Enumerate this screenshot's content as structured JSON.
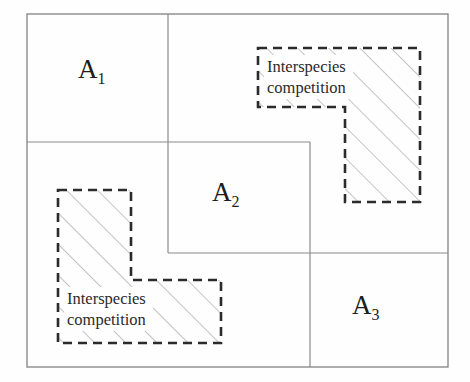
{
  "figure": {
    "type": "diagram",
    "background_color": "#fefefe",
    "line_color": "#8a8a8a",
    "dashed_color": "#2b2b2b",
    "hatch_color": "#8a8a8a",
    "text_color": "#1d1d1d"
  },
  "outer_frame": {
    "x": 27,
    "y": 14,
    "width": 421,
    "height": 353
  },
  "regions": [
    {
      "id": "A1",
      "label_base": "A",
      "label_sub": "1",
      "label_x": 78,
      "label_y": 78,
      "rect": {
        "x": 27,
        "y": 14,
        "width": 141,
        "height": 128
      }
    },
    {
      "id": "A2",
      "label_base": "A",
      "label_sub": "2",
      "label_x": 212,
      "label_y": 201,
      "rect": {
        "x": 168,
        "y": 142,
        "width": 142,
        "height": 111
      }
    },
    {
      "id": "A3",
      "label_base": "A",
      "label_sub": "3",
      "label_x": 352,
      "label_y": 314,
      "rect": {
        "x": 310,
        "y": 253,
        "width": 138,
        "height": 114
      }
    }
  ],
  "divider_lines": [
    {
      "name": "vertical-upper",
      "x1": 168,
      "y1": 14,
      "x2": 168,
      "y2": 253
    },
    {
      "name": "horizontal-left",
      "x1": 27,
      "y1": 142,
      "x2": 310,
      "y2": 142
    },
    {
      "name": "vertical-right",
      "x1": 310,
      "y1": 142,
      "x2": 310,
      "y2": 367
    },
    {
      "name": "horizontal-mid",
      "x1": 168,
      "y1": 253,
      "x2": 448,
      "y2": 253
    }
  ],
  "overlays": [
    {
      "id": "overlay-top-right",
      "label_line1": "Interspecies",
      "label_line2": "competition",
      "label_x": 267,
      "label_y": 72,
      "orientation": "mirrored-L",
      "path": "M 258 48 L 420 48 L 420 202 L 345 202 L 345 107 L 258 107 Z",
      "hatch_bbox": {
        "x": 258,
        "y": 48,
        "width": 162,
        "height": 154
      }
    },
    {
      "id": "overlay-bottom-left",
      "label_line1": "Interspecies",
      "label_line2": "competition",
      "label_x": 67,
      "label_y": 304,
      "orientation": "L",
      "path": "M 58 190 L 131 190 L 131 280 L 221 280 L 221 343 L 58 343 Z",
      "hatch_bbox": {
        "x": 58,
        "y": 190,
        "width": 163,
        "height": 153
      }
    }
  ],
  "hatching": {
    "angle_degrees": 45,
    "spacing_px": 22,
    "stroke_width": 1
  }
}
